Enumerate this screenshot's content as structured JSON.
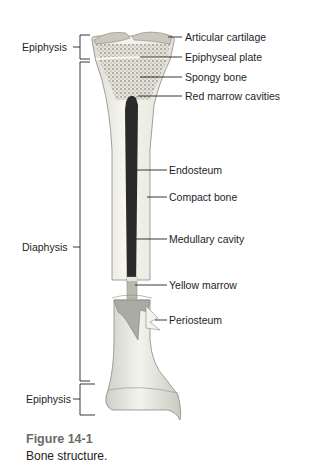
{
  "figure": {
    "title": "Figure 14-1",
    "caption": "Bone structure."
  },
  "left_labels": {
    "epiphysis_top": "Epiphysis",
    "diaphysis": "Diaphysis",
    "epiphysis_bottom": "Epiphysis"
  },
  "right_labels": {
    "articular_cartilage": "Articular cartilage",
    "epiphyseal_plate": "Epiphyseal plate",
    "spongy_bone": "Spongy bone",
    "red_marrow_cavities": "Red marrow cavities",
    "endosteum": "Endosteum",
    "compact_bone": "Compact bone",
    "medullary_cavity": "Medullary cavity",
    "yellow_marrow": "Yellow marrow",
    "periosteum": "Periosteum"
  },
  "colors": {
    "bone_fill": "#f2f0e8",
    "bone_outline": "#8a8a80",
    "cartilage": "#c8c8bc",
    "spongy": "#9a9a90",
    "marrow_dark": "#2a2a2a",
    "yellow_marrow": "#b8b8ae",
    "periosteum": "#a8aca4",
    "caption_title": "#6a6a6a"
  }
}
